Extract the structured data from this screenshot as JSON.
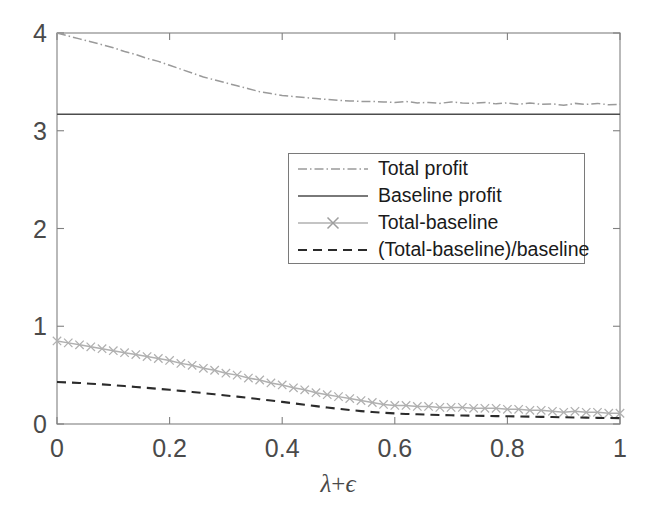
{
  "chart_data": {
    "type": "line",
    "title": "",
    "xlabel": "λ+ϵ",
    "ylabel": "",
    "xlim": [
      0,
      1
    ],
    "ylim": [
      0,
      4
    ],
    "grid": false,
    "legend_position": "upper-center",
    "xticks": [
      "0",
      "0.2",
      "0.4",
      "0.6",
      "0.8",
      "1"
    ],
    "xtick_values": [
      0,
      0.2,
      0.4,
      0.6,
      0.8,
      1
    ],
    "yticks": [
      "0",
      "1",
      "2",
      "3",
      "4"
    ],
    "ytick_values": [
      0,
      1,
      2,
      3,
      4
    ],
    "x": [
      0,
      0.02,
      0.04,
      0.06,
      0.08,
      0.1,
      0.12,
      0.14,
      0.16,
      0.18,
      0.2,
      0.22,
      0.24,
      0.26,
      0.28,
      0.3,
      0.32,
      0.34,
      0.36,
      0.38,
      0.4,
      0.42,
      0.44,
      0.46,
      0.48,
      0.5,
      0.52,
      0.54,
      0.56,
      0.58,
      0.6,
      0.62,
      0.64,
      0.66,
      0.68,
      0.7,
      0.72,
      0.74,
      0.76,
      0.78,
      0.8,
      0.82,
      0.84,
      0.86,
      0.88,
      0.9,
      0.92,
      0.94,
      0.96,
      0.98,
      1
    ],
    "series": [
      {
        "name": "Total profit",
        "style": "dash-dot",
        "color": "#9a9a9a",
        "marker": "none",
        "values": [
          4.0,
          3.97,
          3.94,
          3.91,
          3.88,
          3.85,
          3.81,
          3.78,
          3.74,
          3.71,
          3.67,
          3.63,
          3.59,
          3.55,
          3.52,
          3.49,
          3.46,
          3.43,
          3.4,
          3.38,
          3.36,
          3.35,
          3.34,
          3.33,
          3.32,
          3.31,
          3.305,
          3.3,
          3.3,
          3.295,
          3.29,
          3.3,
          3.285,
          3.29,
          3.28,
          3.295,
          3.285,
          3.28,
          3.29,
          3.275,
          3.285,
          3.27,
          3.285,
          3.27,
          3.275,
          3.26,
          3.28,
          3.27,
          3.28,
          3.265,
          3.27
        ]
      },
      {
        "name": "Baseline profit",
        "style": "solid",
        "color": "#4d4d4d",
        "marker": "none",
        "values": [
          3.17,
          3.17,
          3.17,
          3.17,
          3.17,
          3.17,
          3.17,
          3.17,
          3.17,
          3.17,
          3.17,
          3.17,
          3.17,
          3.17,
          3.17,
          3.17,
          3.17,
          3.17,
          3.17,
          3.17,
          3.17,
          3.17,
          3.17,
          3.17,
          3.17,
          3.17,
          3.17,
          3.17,
          3.17,
          3.17,
          3.17,
          3.17,
          3.17,
          3.17,
          3.17,
          3.17,
          3.17,
          3.17,
          3.17,
          3.17,
          3.17,
          3.17,
          3.17,
          3.17,
          3.17,
          3.17,
          3.17,
          3.17,
          3.17,
          3.17,
          3.17
        ]
      },
      {
        "name": "Total-baseline",
        "style": "solid",
        "color": "#b0b0b0",
        "marker": "x",
        "values": [
          0.85,
          0.83,
          0.81,
          0.79,
          0.77,
          0.75,
          0.73,
          0.71,
          0.69,
          0.67,
          0.65,
          0.62,
          0.6,
          0.57,
          0.55,
          0.52,
          0.5,
          0.47,
          0.45,
          0.42,
          0.4,
          0.37,
          0.35,
          0.32,
          0.3,
          0.28,
          0.26,
          0.24,
          0.22,
          0.2,
          0.19,
          0.19,
          0.18,
          0.18,
          0.17,
          0.17,
          0.17,
          0.16,
          0.16,
          0.16,
          0.15,
          0.15,
          0.14,
          0.14,
          0.13,
          0.12,
          0.13,
          0.12,
          0.12,
          0.11,
          0.11
        ]
      },
      {
        "name": "(Total-baseline)/baseline",
        "style": "dashed",
        "color": "#2b2b2b",
        "marker": "none",
        "values": [
          0.43,
          0.425,
          0.42,
          0.412,
          0.405,
          0.397,
          0.388,
          0.379,
          0.37,
          0.36,
          0.35,
          0.339,
          0.328,
          0.316,
          0.304,
          0.292,
          0.28,
          0.267,
          0.254,
          0.24,
          0.226,
          0.212,
          0.197,
          0.183,
          0.168,
          0.155,
          0.143,
          0.132,
          0.123,
          0.115,
          0.108,
          0.103,
          0.099,
          0.095,
          0.092,
          0.089,
          0.087,
          0.085,
          0.083,
          0.081,
          0.079,
          0.077,
          0.075,
          0.073,
          0.071,
          0.069,
          0.067,
          0.065,
          0.063,
          0.061,
          0.06
        ]
      }
    ]
  },
  "legend": {
    "entries": [
      {
        "label": "Total profit"
      },
      {
        "label": "Baseline profit"
      },
      {
        "label": "Total-baseline"
      },
      {
        "label": "(Total-baseline)/baseline"
      }
    ]
  },
  "axes": {
    "x_title_lambda": "λ",
    "x_title_plus": "+",
    "x_title_epsilon": "ϵ"
  },
  "colors": {
    "background": "#ffffff",
    "axis": "#808080",
    "tick_text": "#4a4a4a",
    "total_profit": "#9a9a9a",
    "baseline_profit": "#4d4d4d",
    "total_minus_baseline": "#b0b0b0",
    "ratio": "#2b2b2b"
  }
}
